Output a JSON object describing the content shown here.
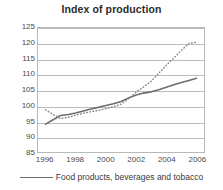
{
  "chart_data": {
    "type": "line",
    "title": "Index of production",
    "xlabel": "",
    "ylabel": "",
    "xlim": [
      1995.5,
      2006.5
    ],
    "ylim": [
      85,
      125
    ],
    "yticks": [
      85,
      90,
      95,
      100,
      105,
      110,
      115,
      120,
      125
    ],
    "xticks": [
      1996,
      1998,
      2000,
      2002,
      2004,
      2006
    ],
    "xtick_labels": [
      "1996",
      "1998",
      "2000",
      "2002",
      "2004",
      "2006"
    ],
    "ytick_labels": [
      "85",
      "90",
      "95",
      "100",
      "105",
      "110",
      "115",
      "120",
      "125"
    ],
    "grid": true,
    "legend_position": "bottom",
    "x": [
      1996,
      1996.5,
      1997,
      1997.5,
      1998,
      1998.5,
      1999,
      1999.5,
      2000,
      2000.5,
      2001,
      2001.5,
      2002,
      2002.5,
      2003,
      2003.5,
      2004,
      2004.5,
      2005,
      2005.5,
      2006
    ],
    "series": [
      {
        "name": "Food products, beverages and tobacco",
        "style": "solid",
        "color": "#6d6d6d",
        "values": [
          94.0,
          95.4,
          96.8,
          97.1,
          97.6,
          98.2,
          98.9,
          99.4,
          100.0,
          100.6,
          101.3,
          102.4,
          103.4,
          104.0,
          104.4,
          105.1,
          105.9,
          106.7,
          107.4,
          108.1,
          108.8
        ]
      },
      {
        "name": "Total manufacturing",
        "style": "dotted",
        "color": "#8a8a8a",
        "values": [
          98.6,
          97.1,
          95.8,
          96.2,
          96.9,
          97.5,
          98.0,
          98.4,
          99.0,
          99.6,
          100.4,
          102.2,
          104.3,
          106.0,
          107.8,
          110.4,
          113.0,
          115.3,
          117.8,
          120.0,
          120.4
        ]
      }
    ]
  },
  "legend": {
    "entries": [
      {
        "label": "Food products, beverages and tobacco"
      }
    ]
  }
}
